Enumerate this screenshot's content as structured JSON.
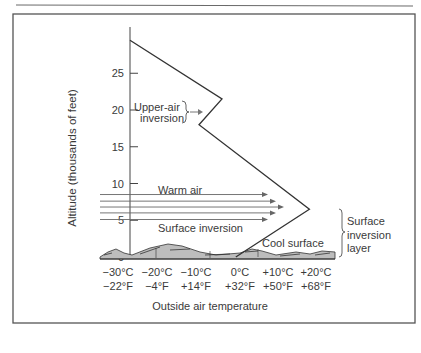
{
  "figure": {
    "y_axis_title": "Altitude (thousands of feet)",
    "x_axis_title": "Outside air temperature",
    "annotations": {
      "upper_air_inversion": [
        "Upper-air",
        "inversion"
      ],
      "warm_air": "Warm air",
      "surface_inversion": "Surface inversion",
      "cool_surface": "Cool surface",
      "surface_inversion_layer": [
        "Surface",
        "inversion",
        "layer"
      ]
    }
  },
  "chart_data": {
    "type": "line",
    "title": "",
    "xlabel": "Outside air temperature",
    "ylabel": "Altitude (thousands of feet)",
    "y_ticks": [
      "0",
      "5",
      "10",
      "15",
      "20",
      "25"
    ],
    "y_tick_values": [
      0,
      5,
      10,
      15,
      20,
      25
    ],
    "x_ticks_celsius": [
      "−30°C",
      "−20°C",
      "−10°C",
      "0°C",
      "+10°C",
      "+20°C"
    ],
    "x_ticks_fahrenheit": [
      "−22°F",
      "−4°F",
      "+14°F",
      "+32°F",
      "+50°F",
      "+68°F"
    ],
    "x_tick_values_celsius": [
      -30,
      -20,
      -10,
      0,
      10,
      20
    ],
    "ylim": [
      0,
      29
    ],
    "xlim_celsius": [
      -34,
      22
    ],
    "series": [
      {
        "name": "Temperature profile",
        "points_celsius_altitude": [
          [
            -34,
            29.5
          ],
          [
            -14,
            21.5
          ],
          [
            -19,
            18
          ],
          [
            5,
            6.5
          ],
          [
            -11,
            0
          ]
        ]
      }
    ],
    "warm_air_arrows": {
      "count": 5,
      "altitudes": [
        8.5,
        7.6,
        6.8,
        6.0,
        5.1
      ]
    },
    "grid": false,
    "legend": "none"
  }
}
